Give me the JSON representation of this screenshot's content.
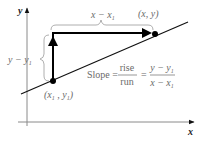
{
  "diagram": {
    "axes": {
      "x_label": "x",
      "y_label": "y"
    },
    "points": {
      "p1": {
        "label": "(x₁ , y₁)",
        "label_x": "x",
        "label_x_sub": "1",
        "label_y": "y",
        "label_y_sub": "1"
      },
      "p2": {
        "label": "(x, y)"
      }
    },
    "run_label": {
      "text": "x − x₁",
      "main": "x − x",
      "sub": "1"
    },
    "rise_label": {
      "text": "y − y₁",
      "main": "y − y",
      "sub": "1"
    },
    "formula": {
      "prefix": "Slope =",
      "frac1_num": "rise",
      "frac1_den": "run",
      "equals": "=",
      "frac2_num_main": "y − y",
      "frac2_num_sub": "1",
      "frac2_den_main": "x − x",
      "frac2_den_sub": "1"
    },
    "colors": {
      "axis": "#8a8a8a",
      "line": "#111111",
      "arrows": "#000000",
      "braces": "#9a9a9a",
      "text": "#6a6a6a"
    }
  }
}
